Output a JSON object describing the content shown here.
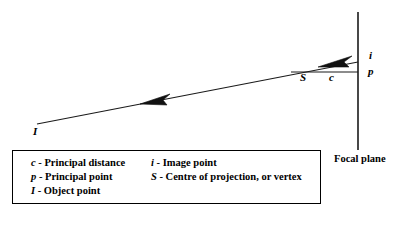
{
  "diagram": {
    "stroke_color": "#1a1a1a",
    "background_color": "#ffffff",
    "points": {
      "I": {
        "label": "I",
        "name": "object-point",
        "x": 37,
        "y": 124
      },
      "S": {
        "label": "S",
        "name": "centre-of-projection",
        "x": 307,
        "y": 66
      },
      "c": {
        "label": "c",
        "name": "principal-distance",
        "x": 332,
        "y": 72
      },
      "i": {
        "label": "i",
        "name": "image-point",
        "x": 358,
        "y": 62
      },
      "p": {
        "label": "p",
        "name": "principal-point",
        "x": 358,
        "y": 72
      }
    },
    "focal_plane": {
      "label": "Focal plane",
      "x": 358,
      "y_top": 12,
      "y_bottom": 150
    },
    "ray": {
      "from": "I",
      "to": "i",
      "arrow_direction": "toward-object-point",
      "arrow_count": 2
    },
    "principal_axis": {
      "from": "S",
      "to": "p",
      "label": "c"
    }
  },
  "legend": {
    "columns": [
      {
        "name": "legend-column-left",
        "entries": [
          {
            "symbol": "c",
            "dash": " - ",
            "description": "Principal distance"
          },
          {
            "symbol": "p",
            "dash": " - ",
            "description": "Principal point"
          },
          {
            "symbol": "I",
            "dash": " - ",
            "description": "Object point"
          }
        ]
      },
      {
        "name": "legend-column-right",
        "entries": [
          {
            "symbol": "i",
            "dash": " - ",
            "description": "Image point"
          },
          {
            "symbol": "S",
            "dash": " - ",
            "description": "Centre of projection, or vertex"
          }
        ]
      }
    ]
  }
}
